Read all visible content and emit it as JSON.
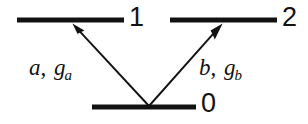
{
  "figure": {
    "kind": "energy-level-diagram",
    "background_color": "#ffffff",
    "stroke_color": "#121212"
  },
  "levels": [
    {
      "id": "0",
      "label": "0",
      "role": "ground-state",
      "x1": 92,
      "x2": 196,
      "y": 107
    },
    {
      "id": "1",
      "label": "1",
      "role": "excited-state-left",
      "x1": 17,
      "x2": 124,
      "y": 20
    },
    {
      "id": "2",
      "label": "2",
      "role": "excited-state-right",
      "x1": 170,
      "x2": 277,
      "y": 20
    }
  ],
  "transitions": [
    {
      "id": "a",
      "from": "0",
      "to": "1",
      "mode": "a",
      "coupling": "g",
      "coupling_subscript": "a",
      "separator": ", ",
      "label_text": "a, g",
      "arrow": {
        "x1": 149,
        "y1": 106,
        "x2": 73,
        "y2": 24
      }
    },
    {
      "id": "b",
      "from": "0",
      "to": "2",
      "mode": "b",
      "coupling": "g",
      "coupling_subscript": "b",
      "separator": ", ",
      "label_text": "b, g",
      "arrow": {
        "x1": 149,
        "y1": 106,
        "x2": 222,
        "y2": 24
      }
    }
  ]
}
